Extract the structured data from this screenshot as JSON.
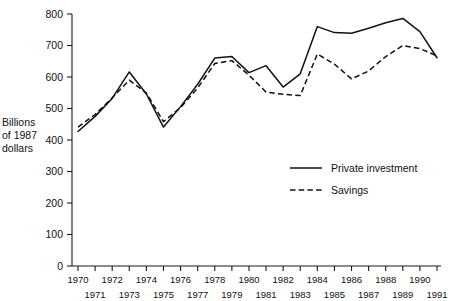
{
  "chart_data": {
    "type": "line",
    "title": "",
    "subtitle": "",
    "xlabel": "",
    "ylabel": "Billions of 1987 dollars",
    "ylabel_lines": [
      "Billions",
      "of 1987",
      "dollars"
    ],
    "xlim": [
      1970,
      1991
    ],
    "ylim": [
      0,
      800
    ],
    "ytick_step": 100,
    "yticks": [
      0,
      100,
      200,
      300,
      400,
      500,
      600,
      700,
      800
    ],
    "ytick_labels": [
      "0",
      "100",
      "200",
      "300",
      "400",
      "500",
      "600",
      "700",
      "800"
    ],
    "x": [
      1970,
      1971,
      1972,
      1973,
      1974,
      1975,
      1976,
      1977,
      1978,
      1979,
      1980,
      1981,
      1982,
      1983,
      1984,
      1985,
      1986,
      1987,
      1988,
      1989,
      1990,
      1991
    ],
    "xtick_labels": [
      "1970",
      "1971",
      "1972",
      "1973",
      "1974",
      "1975",
      "1976",
      "1977",
      "1978",
      "1979",
      "1980",
      "1981",
      "1982",
      "1983",
      "1984",
      "1985",
      "1986",
      "1987",
      "1988",
      "1989",
      "1990",
      "1991"
    ],
    "xtick_rows": {
      "top_row_years": [
        1970,
        1972,
        1974,
        1976,
        1978,
        1980,
        1982,
        1984,
        1986,
        1988,
        1990
      ],
      "bottom_row_years": [
        1971,
        1973,
        1975,
        1977,
        1979,
        1981,
        1983,
        1985,
        1987,
        1989,
        1991
      ]
    },
    "grid": false,
    "legend_position": "center-right-inside",
    "series": [
      {
        "name": "Private investment",
        "style": "solid",
        "color": "#111111",
        "values": [
          427,
          475,
          532,
          616,
          546,
          441,
          506,
          577,
          660,
          665,
          614,
          636,
          568,
          610,
          760,
          741,
          739,
          755,
          772,
          786,
          744,
          661
        ]
      },
      {
        "name": "Savings",
        "style": "dashed",
        "color": "#111111",
        "values": [
          441,
          481,
          534,
          590,
          549,
          458,
          503,
          565,
          643,
          652,
          606,
          552,
          545,
          541,
          673,
          641,
          594,
          619,
          665,
          700,
          690,
          667
        ]
      }
    ]
  },
  "legend": {
    "items": [
      {
        "label": "Private investment",
        "style": "solid"
      },
      {
        "label": "Savings",
        "style": "dashed"
      }
    ]
  }
}
